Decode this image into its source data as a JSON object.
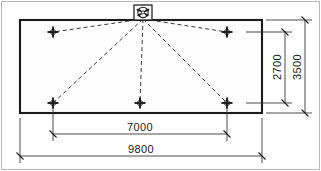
{
  "drawing": {
    "type": "floor-plan-dimension-drawing",
    "canvas": {
      "width": 321,
      "height": 171,
      "background": "#ffffff"
    },
    "frame": {
      "stroke": "#b8b8b8"
    },
    "outline": {
      "name": "building-footprint",
      "x": 20,
      "y": 20,
      "width": 242,
      "height": 93,
      "stroke": "#1c1c1c",
      "fill": "#fefefe"
    },
    "fixture": {
      "name": "ceiling-fan-symbol",
      "label": "fan-symbol",
      "box": {
        "x": 134,
        "y": 5,
        "width": 18,
        "height": 15
      },
      "center": {
        "x": 143,
        "y": 12.5
      },
      "radius": 5.4
    },
    "markers": [
      {
        "name": "anchor-point-top-left",
        "x": 53,
        "y": 32
      },
      {
        "name": "anchor-point-top-right",
        "x": 227,
        "y": 32
      },
      {
        "name": "anchor-point-bottom-left",
        "x": 53,
        "y": 103
      },
      {
        "name": "anchor-point-bottom-center",
        "x": 140,
        "y": 103
      },
      {
        "name": "anchor-point-bottom-right",
        "x": 227,
        "y": 103
      }
    ],
    "rays": {
      "name": "dashed-guy-lines",
      "origin": {
        "x": 143,
        "y": 19
      },
      "stroke": "#3a3a3a",
      "dash": "4 3"
    },
    "dimensions": [
      {
        "name": "dimension-2700",
        "value": "2700",
        "orientation": "vertical",
        "axis_x": 285,
        "from": 32,
        "to": 103,
        "text_x": 281,
        "text_y": 67
      },
      {
        "name": "dimension-3500",
        "value": "3500",
        "orientation": "vertical",
        "axis_x": 305,
        "from": 20,
        "to": 113,
        "text_x": 301,
        "text_y": 67
      },
      {
        "name": "dimension-7000",
        "value": "7000",
        "orientation": "horizontal",
        "axis_y": 134,
        "from": 53,
        "to": 227,
        "text_x": 140,
        "text_y": 131
      },
      {
        "name": "dimension-9800",
        "value": "9800",
        "orientation": "horizontal",
        "axis_y": 156,
        "from": 20,
        "to": 262,
        "text_x": 141,
        "text_y": 153
      }
    ]
  }
}
